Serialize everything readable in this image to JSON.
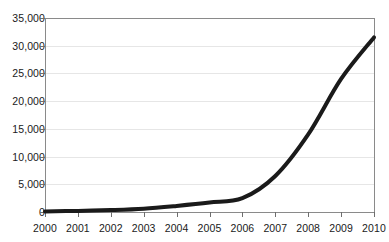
{
  "chart_data": {
    "type": "line",
    "title": "",
    "subtitle": "",
    "xlabel": "",
    "ylabel": "",
    "x": [
      2000,
      2001,
      2002,
      2003,
      2004,
      2005,
      2006,
      2007,
      2008,
      2009,
      2010
    ],
    "categories": [
      "2000",
      "2001",
      "2002",
      "2003",
      "2004",
      "2005",
      "2006",
      "2007",
      "2008",
      "2009",
      "2010"
    ],
    "values": [
      100,
      200,
      350,
      600,
      1100,
      1700,
      2500,
      6500,
      14000,
      24000,
      31500
    ],
    "series": [
      {
        "name": "",
        "values": [
          100,
          200,
          350,
          600,
          1100,
          1700,
          2500,
          6500,
          14000,
          24000,
          31500
        ]
      }
    ],
    "ylim": [
      0,
      35000
    ],
    "xlim": [
      2000,
      2010
    ],
    "ytick_values": [
      0,
      5000,
      10000,
      15000,
      20000,
      25000,
      30000,
      35000
    ],
    "ytick_labels": [
      "0",
      "5,000",
      "10,000",
      "15,000",
      "20,000",
      "25,000",
      "30,000",
      "35,000"
    ],
    "xtick_labels": [
      "2000",
      "2001",
      "2002",
      "2003",
      "2004",
      "2005",
      "2006",
      "2007",
      "2008",
      "2009",
      "2010"
    ],
    "grid": true,
    "grid_axis": "y",
    "legend": false,
    "legend_position": "none",
    "annotations": [],
    "line_color": "#1a1a1a",
    "line_width": 4,
    "grid_color": "#e6e6e6",
    "axis_color": "#8a8a8a",
    "background_color": "#ffffff"
  }
}
